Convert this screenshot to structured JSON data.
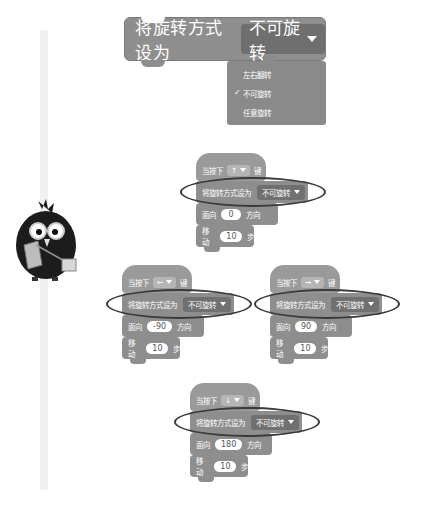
{
  "top_block": {
    "label": "将旋转方式设为",
    "selected": "不可旋转"
  },
  "dropdown_menu": {
    "items": [
      {
        "label": "左右翻转",
        "checked": false
      },
      {
        "label": "不可旋转",
        "checked": true
      },
      {
        "label": "任意旋转",
        "checked": false
      }
    ],
    "check_glyph": "✓"
  },
  "sprite": {
    "description": "black bird character with glasses holding papers"
  },
  "scripts": [
    {
      "id": "up",
      "hat": {
        "prefix": "当按下",
        "key": "↑",
        "suffix": "键"
      },
      "rotation": {
        "label": "将旋转方式设为",
        "value": "不可旋转"
      },
      "point": {
        "label": "面向",
        "value": "0",
        "suffix": "方向"
      },
      "move": {
        "label": "移动",
        "value": "10",
        "suffix": "步"
      }
    },
    {
      "id": "left",
      "hat": {
        "prefix": "当按下",
        "key": "←",
        "suffix": "键"
      },
      "rotation": {
        "label": "将旋转方式设为",
        "value": "不可旋转"
      },
      "point": {
        "label": "面向",
        "value": "-90",
        "suffix": "方向"
      },
      "move": {
        "label": "移动",
        "value": "10",
        "suffix": "步"
      }
    },
    {
      "id": "right",
      "hat": {
        "prefix": "当按下",
        "key": "→",
        "suffix": "键"
      },
      "rotation": {
        "label": "将旋转方式设为",
        "value": "不可旋转"
      },
      "point": {
        "label": "面向",
        "value": "90",
        "suffix": "方向"
      },
      "move": {
        "label": "移动",
        "value": "10",
        "suffix": "步"
      }
    },
    {
      "id": "down",
      "hat": {
        "prefix": "当按下",
        "key": "↓",
        "suffix": "键"
      },
      "rotation": {
        "label": "将旋转方式设为",
        "value": "不可旋转"
      },
      "point": {
        "label": "面向",
        "value": "180",
        "suffix": "方向"
      },
      "move": {
        "label": "移动",
        "value": "10",
        "suffix": "步"
      }
    }
  ],
  "colors": {
    "block": "#8e8e8e",
    "dropdown": "#6f6f6f",
    "highlight_ellipse": "#3a3a3a"
  }
}
